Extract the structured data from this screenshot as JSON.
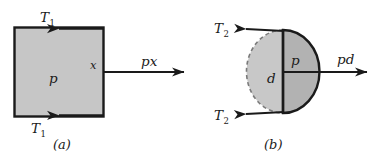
{
  "figure": {
    "background_color": "#ffffff",
    "width": 381,
    "height": 161
  },
  "style": {
    "stroke_color": "#1a1a1a",
    "fill_gray_light": "#c6c6c6",
    "fill_gray_dark": "#b4b4b4",
    "dashed_stroke": "#6e6e6e"
  },
  "panels": [
    {
      "id": "a",
      "caption": "(a)",
      "shape": "square",
      "shape_labels": {
        "interior_pressure": "p",
        "side_length": "x"
      },
      "force_labels": {
        "top_tension": "T",
        "top_tension_sub": "1",
        "bottom_tension": "T",
        "bottom_tension_sub": "1",
        "resultant": "px"
      },
      "arrows": [
        {
          "name": "top-tension-arrow",
          "direction": "left"
        },
        {
          "name": "bottom-tension-arrow",
          "direction": "left"
        },
        {
          "name": "pressure-resultant-arrow",
          "direction": "right"
        }
      ]
    },
    {
      "id": "b",
      "caption": "(b)",
      "shape": "circle",
      "shape_labels": {
        "interior_pressure": "p",
        "diameter": "d"
      },
      "force_labels": {
        "top_tension": "T",
        "top_tension_sub": "2",
        "bottom_tension": "T",
        "bottom_tension_sub": "2",
        "resultant": "pd"
      },
      "arrows": [
        {
          "name": "top-tension-arrow",
          "direction": "left"
        },
        {
          "name": "bottom-tension-arrow",
          "direction": "left"
        },
        {
          "name": "pressure-resultant-arrow",
          "direction": "right"
        }
      ]
    }
  ]
}
